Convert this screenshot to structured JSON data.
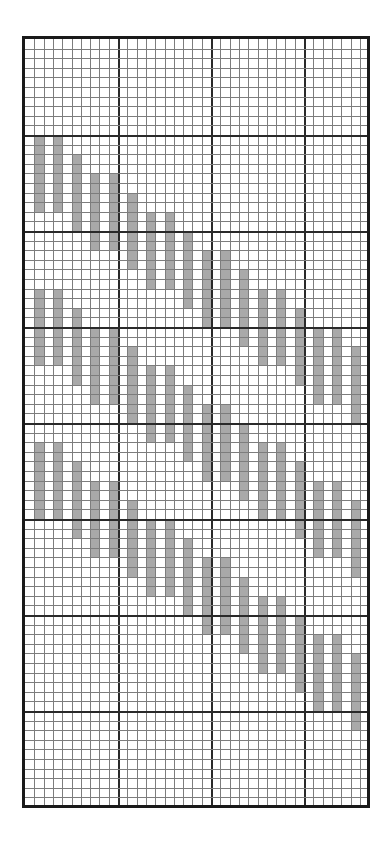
{
  "diagram": {
    "type": "weaving-draft-grid",
    "grid": {
      "columns": 37,
      "rows": 80,
      "cell_width_px": 9.3,
      "cell_height_px": 9.6,
      "major_every": 10,
      "line_color": "#7d7d7d",
      "major_line_color": "#2a2a2a",
      "border_color": "#1a1a1a"
    },
    "bar_color": "#a9a9a9",
    "bar_height_rows": 8,
    "bar_columns": [
      1,
      3,
      5,
      7,
      9,
      11,
      13,
      15,
      17,
      19,
      21,
      23,
      25,
      27,
      29,
      31,
      33,
      35
    ],
    "row_offsets": [
      0,
      0,
      2,
      4,
      4,
      6,
      8,
      8,
      10,
      12,
      12,
      14,
      16,
      16,
      18,
      20,
      20,
      22
    ],
    "bands": [
      {
        "name": "band-1",
        "start_row": 10
      },
      {
        "name": "band-2",
        "start_row": 26
      },
      {
        "name": "band-3",
        "start_row": 42
      }
    ]
  }
}
